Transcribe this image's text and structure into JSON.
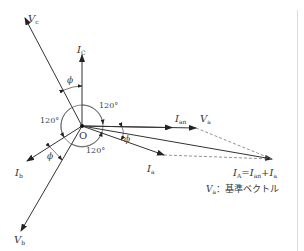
{
  "diagram": {
    "origin_label": "O",
    "vectors": [
      {
        "id": "Va",
        "label": "V",
        "sub": "a",
        "dot": true
      },
      {
        "id": "Vb",
        "label": "V",
        "sub": "b",
        "dot": true
      },
      {
        "id": "Vc",
        "label": "V",
        "sub": "c",
        "dot": true
      },
      {
        "id": "Ia",
        "label": "I",
        "sub": "a",
        "dot": true
      },
      {
        "id": "Ib",
        "label": "I",
        "sub": "b",
        "dot": true
      },
      {
        "id": "Ic",
        "label": "I",
        "sub": "C",
        "dot": true
      },
      {
        "id": "Ian",
        "label": "I",
        "sub": "an",
        "dot": true
      },
      {
        "id": "IA",
        "label": "I",
        "sub": "A",
        "dot": true
      }
    ],
    "angles": {
      "a120_top": "120°",
      "a120_left": "120°",
      "a120_bottom": "120°",
      "phi": "ϕ"
    },
    "equation": {
      "lhs": "I",
      "lhs_sub": "A",
      "eq": "=",
      "t1": "I",
      "t1_sub": "an",
      "plus": "+",
      "t2": "I",
      "t2_sub": "a"
    },
    "note": {
      "symbol": "V",
      "sub": "a",
      "text": "：基準ベクトル"
    }
  }
}
